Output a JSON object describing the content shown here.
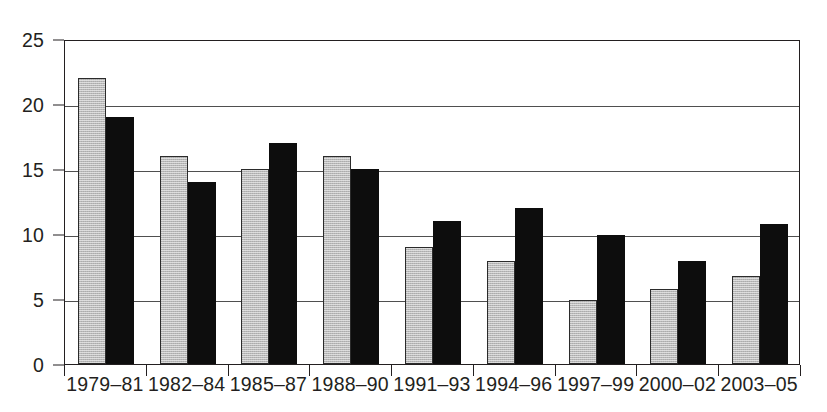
{
  "chart_data": {
    "type": "bar",
    "title": "",
    "subtitle": "",
    "xlabel": "",
    "ylabel": "",
    "ylim": [
      0,
      25
    ],
    "yticks": [
      0,
      5,
      10,
      15,
      20,
      25
    ],
    "grid": true,
    "legend": "none",
    "categories": [
      "1979–81",
      "1982–84",
      "1985–87",
      "1988–90",
      "1991–93",
      "1994–96",
      "1997–99",
      "2000–02",
      "2003–05"
    ],
    "series": [
      {
        "name": "series-gray",
        "color": "#b9b9b9",
        "values": [
          22,
          16,
          15,
          16,
          9,
          7.9,
          4.9,
          5.8,
          6.8
        ]
      },
      {
        "name": "series-black",
        "color": "#0d0d0d",
        "values": [
          19,
          14,
          17,
          15,
          11,
          12,
          9.9,
          7.9,
          10.8
        ]
      }
    ]
  },
  "axes": {
    "y_tick_labels": [
      "0",
      "5",
      "10",
      "15",
      "20",
      "25"
    ]
  }
}
